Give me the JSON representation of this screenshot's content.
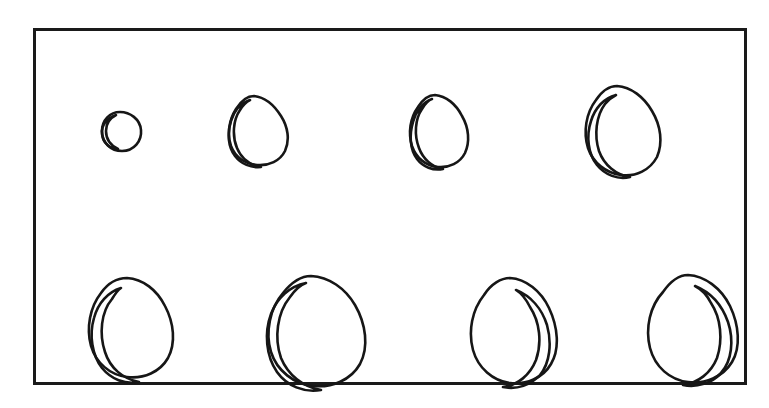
{
  "figure": {
    "background_color": "#ffffff",
    "ink_color": "#161616",
    "frame": {
      "x": 33,
      "y": 28,
      "width": 714,
      "height": 357,
      "stroke_color": "#1a1a1a",
      "stroke_width": 3
    },
    "layout": {
      "rows": 2,
      "columns": 4,
      "total_specimens": 8
    }
  },
  "chart_data": {
    "type": "scatter",
    "xlabel": "",
    "ylabel": "",
    "grid": false,
    "legend": "none",
    "categories": [
      "1",
      "2",
      "3",
      "4",
      "5",
      "6",
      "7",
      "8"
    ],
    "values": [
      20,
      40,
      42,
      62,
      68,
      86,
      72,
      82
    ],
    "specimens": [
      {
        "id": "specimen-1",
        "row": 1,
        "column": 1,
        "center_x": 120,
        "center_y": 131,
        "width": 41,
        "height": 40,
        "relative_size": 20,
        "contours": 2
      },
      {
        "id": "specimen-2",
        "row": 1,
        "column": 2,
        "center_x": 259,
        "center_y": 130,
        "width": 57,
        "height": 69,
        "relative_size": 40,
        "contours": 2
      },
      {
        "id": "specimen-3",
        "row": 1,
        "column": 3,
        "center_x": 437,
        "center_y": 130,
        "width": 56,
        "height": 72,
        "relative_size": 42,
        "contours": 2
      },
      {
        "id": "specimen-4",
        "row": 1,
        "column": 4,
        "center_x": 621,
        "center_y": 128,
        "width": 70,
        "height": 87,
        "relative_size": 62,
        "contours": 2
      },
      {
        "id": "specimen-5",
        "row": 2,
        "column": 1,
        "center_x": 128,
        "center_y": 323,
        "width": 78,
        "height": 92,
        "relative_size": 68,
        "contours": 2
      },
      {
        "id": "specimen-6",
        "row": 2,
        "column": 2,
        "center_x": 313,
        "center_y": 325,
        "width": 90,
        "height": 100,
        "relative_size": 86,
        "contours": 2
      },
      {
        "id": "specimen-7",
        "row": 2,
        "column": 3,
        "center_x": 512,
        "center_y": 324,
        "width": 80,
        "height": 93,
        "relative_size": 72,
        "contours": 2
      },
      {
        "id": "specimen-8",
        "row": 2,
        "column": 4,
        "center_x": 692,
        "center_y": 322,
        "width": 84,
        "height": 96,
        "relative_size": 82,
        "contours": 2
      }
    ]
  }
}
